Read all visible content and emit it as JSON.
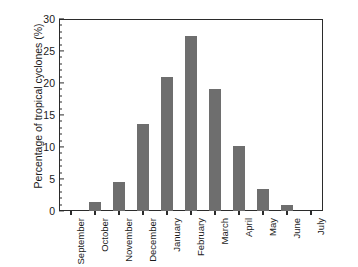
{
  "chart_data": {
    "type": "bar",
    "title": "",
    "xlabel": "",
    "ylabel": "Percentage of tropical cyclones (%)",
    "categories": [
      "September",
      "October",
      "November",
      "December",
      "January",
      "February",
      "March",
      "April",
      "May",
      "June",
      "July"
    ],
    "values": [
      0,
      1.4,
      4.6,
      13.6,
      21.0,
      27.3,
      19.0,
      10.2,
      3.5,
      1.0,
      0
    ],
    "ylim": [
      0,
      30
    ],
    "xlim_note": "categorical, 11 month categories",
    "y_ticks": [
      0,
      5,
      10,
      15,
      20,
      25,
      30
    ],
    "y_tick_labels": [
      "0",
      "5",
      "10",
      "15",
      "20",
      "25",
      "30"
    ],
    "y_minor_tick_interval": 1,
    "grid": false,
    "legend": null,
    "legend_position": "none",
    "bar_color": "#6e6e6e",
    "axis_color": "#2b2b2b",
    "background_color": "#ffffff",
    "annotations": []
  }
}
